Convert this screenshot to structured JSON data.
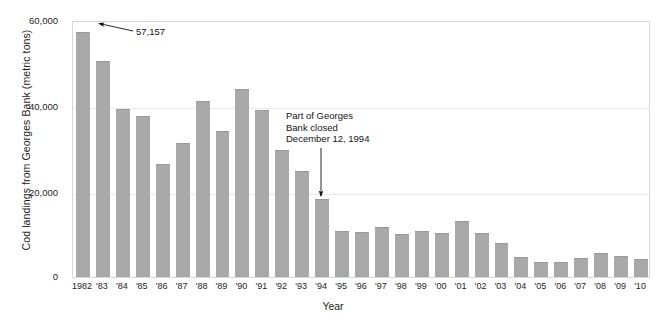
{
  "chart_data": {
    "type": "bar",
    "title": "",
    "xlabel": "Year",
    "ylabel": "Cod landings from Georges Bank (metric tons)",
    "ylim": [
      0,
      60000
    ],
    "yticks": [
      0,
      20000,
      40000,
      60000
    ],
    "ytick_labels": [
      "0",
      "20,000",
      "40,000",
      "60,000"
    ],
    "grid": true,
    "legend": "none",
    "bar_color": "#a9a9a9",
    "categories": [
      "1982",
      "'83",
      "'84",
      "'85",
      "'86",
      "'87",
      "'88",
      "'89",
      "'90",
      "'91",
      "'92",
      "'93",
      "'94",
      "'95",
      "'96",
      "'97",
      "'98",
      "'99",
      "'00",
      "'01",
      "'02",
      "'03",
      "'04",
      "'05",
      "'06",
      "'07",
      "'08",
      "'09",
      "'10"
    ],
    "x_full": [
      1982,
      1983,
      1984,
      1985,
      1986,
      1987,
      1988,
      1989,
      1990,
      1991,
      1992,
      1993,
      1994,
      1995,
      1996,
      1997,
      1998,
      1999,
      2000,
      2001,
      2002,
      2003,
      2004,
      2005,
      2006,
      2007,
      2008,
      2009,
      2010
    ],
    "values": [
      57157,
      50400,
      39200,
      37500,
      26500,
      31400,
      41000,
      34000,
      44000,
      39100,
      29600,
      24800,
      18200,
      10800,
      10500,
      11600,
      10100,
      10700,
      10200,
      13000,
      10300,
      8000,
      4600,
      3500,
      3400,
      4500,
      5500,
      5000,
      4300
    ],
    "annotations": [
      {
        "id": "peak-value",
        "text": "57,157",
        "target_category": "1982",
        "target_value": 57157,
        "arrow": "points-left-to-first-bar"
      },
      {
        "id": "closure-note",
        "lines": [
          "Part of Georges",
          "Bank closed",
          "December 12, 1994"
        ],
        "target_category": "'94",
        "target_value": 18200,
        "arrow": "points-down-to-1994-bar"
      }
    ]
  },
  "annotation_peak": {
    "label": "57,157"
  },
  "annotation_closure": {
    "line1": "Part of Georges",
    "line2": "Bank closed",
    "line3": "December 12, 1994"
  },
  "axes": {
    "y_title": "Cod landings from Georges Bank (metric tons)",
    "x_title": "Year",
    "y_ticks": [
      "60,000",
      "40,000",
      "20,000",
      "0"
    ]
  },
  "colors": {
    "bar": "#a9a9a9",
    "bar_edge": "#9a9a9a",
    "grid": "#e9e9e9",
    "frame": "#d8d8d8",
    "text": "#1d1d1d",
    "background": "#ffffff"
  }
}
